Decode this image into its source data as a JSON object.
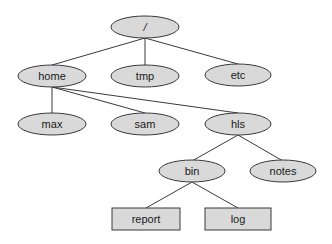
{
  "diagram": {
    "type": "directory-tree",
    "colors": {
      "node_fill": "#d9d9d9",
      "stroke": "#3a3a3a",
      "text": "#1a1a1a",
      "background": "#ffffff"
    },
    "nodes": [
      {
        "id": "root",
        "label": "/",
        "shape": "ellipse",
        "cx": 145,
        "cy": 27
      },
      {
        "id": "home",
        "label": "home",
        "shape": "ellipse",
        "cx": 52,
        "cy": 76
      },
      {
        "id": "tmp",
        "label": "tmp",
        "shape": "ellipse",
        "cx": 145,
        "cy": 76
      },
      {
        "id": "etc",
        "label": "etc",
        "shape": "ellipse",
        "cx": 238,
        "cy": 75
      },
      {
        "id": "max",
        "label": "max",
        "shape": "ellipse",
        "cx": 52,
        "cy": 124
      },
      {
        "id": "sam",
        "label": "sam",
        "shape": "ellipse",
        "cx": 145,
        "cy": 124
      },
      {
        "id": "hls",
        "label": "hls",
        "shape": "ellipse",
        "cx": 238,
        "cy": 124
      },
      {
        "id": "bin",
        "label": "bin",
        "shape": "ellipse",
        "cx": 192,
        "cy": 171
      },
      {
        "id": "notes",
        "label": "notes",
        "shape": "ellipse",
        "cx": 283,
        "cy": 171
      },
      {
        "id": "report",
        "label": "report",
        "shape": "rect",
        "cx": 146,
        "cy": 219
      },
      {
        "id": "log",
        "label": "log",
        "shape": "rect",
        "cx": 238,
        "cy": 219
      }
    ],
    "edges": [
      [
        "root",
        "home"
      ],
      [
        "root",
        "tmp"
      ],
      [
        "root",
        "etc"
      ],
      [
        "home",
        "max"
      ],
      [
        "home",
        "sam"
      ],
      [
        "home",
        "hls"
      ],
      [
        "hls",
        "bin"
      ],
      [
        "hls",
        "notes"
      ],
      [
        "bin",
        "report"
      ],
      [
        "bin",
        "log"
      ]
    ]
  }
}
